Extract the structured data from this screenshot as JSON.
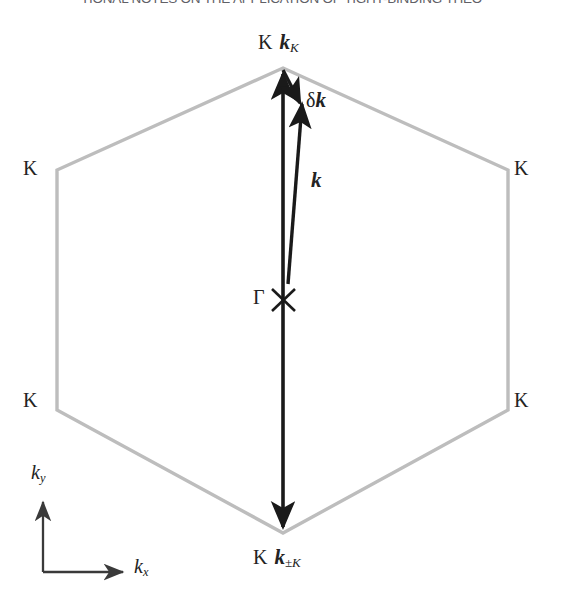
{
  "page": {
    "width": 563,
    "height": 615,
    "background": "#ffffff"
  },
  "running_header": {
    "text": "TIONAL NOTES ON THE APPLICATION OF TIGHT-BINDING THEO",
    "color": "#53535a",
    "clipped": true
  },
  "figure": {
    "hexagon_color": "#bdbdbd",
    "arrow_color": "#1a1a1a",
    "axis_color": "#3a3a3a",
    "labels": {
      "vertex_top": "K",
      "vertex_upper_left": "K",
      "vertex_upper_right": "K",
      "vertex_lower_left": "K",
      "vertex_lower_right": "K",
      "vertex_bottom": "K",
      "gamma": "Γ",
      "k_top_vector": "k",
      "k_top_subscript": "K",
      "k_bottom_vector": "k",
      "k_bottom_subscript": "±K",
      "delta_symbol": "δ",
      "delta_k_vector": "k",
      "k_vector": "k",
      "axis_y_symbol": "k",
      "axis_y_subscript": "y",
      "axis_x_symbol": "k",
      "axis_x_subscript": "x"
    },
    "geometry": {
      "hexagon_vertices": [
        [
          283,
          68
        ],
        [
          508,
          170
        ],
        [
          508,
          410
        ],
        [
          283,
          533
        ],
        [
          57,
          410
        ],
        [
          57,
          170
        ]
      ],
      "gamma_point": [
        283,
        300
      ],
      "k_K_arrow": {
        "from": [
          283,
          300
        ],
        "to": [
          283,
          68
        ]
      },
      "k_pmK_arrow": {
        "from": [
          283,
          300
        ],
        "to": [
          283,
          533
        ]
      },
      "k_arrow": {
        "from": [
          288,
          284
        ],
        "to": [
          303,
          99
        ]
      },
      "delta_k_arrow": {
        "from": [
          283,
          70
        ],
        "to": [
          301,
          107
        ]
      },
      "axis_origin": [
        43,
        572
      ],
      "axis_y_tip": [
        43,
        497
      ],
      "axis_x_tip": [
        128,
        572
      ]
    }
  }
}
